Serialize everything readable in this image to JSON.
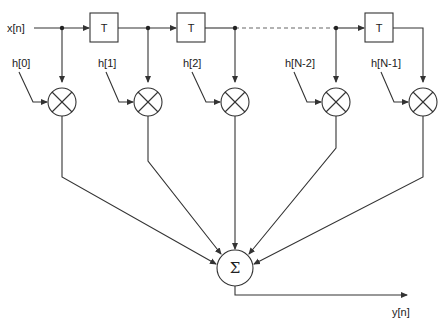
{
  "diagram": {
    "type": "FIR filter (tapped delay line)",
    "input_label": "x[n]",
    "output_label": "y[n]",
    "delay_label": "T",
    "sum_symbol": "Σ",
    "coefficients": [
      "h[0]",
      "h[1]",
      "h[2]",
      "h[N-2]",
      "h[N-1]"
    ],
    "delays": [
      "T",
      "T",
      "T"
    ],
    "stroke_color": "#333333",
    "dashed_segment": "between h[2] tap and h[N-2] tap"
  }
}
